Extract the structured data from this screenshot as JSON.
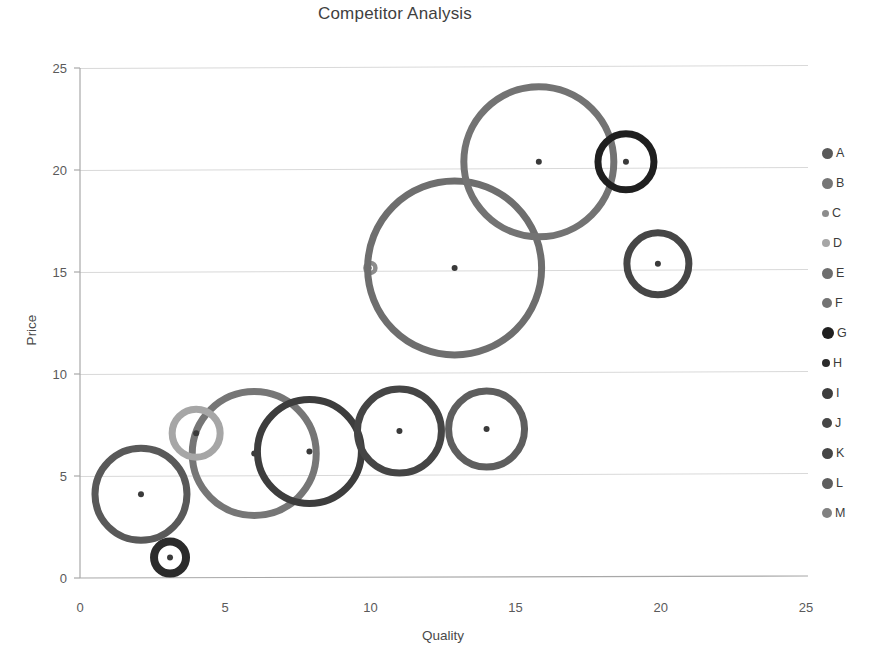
{
  "chart_data": {
    "type": "scatter",
    "title": "Competitor Analysis",
    "xlabel": "Quality",
    "ylabel": "Price",
    "xlim": [
      0,
      25
    ],
    "ylim": [
      0,
      25
    ],
    "xticks": [
      "0",
      "5",
      "10",
      "15",
      "20",
      "25"
    ],
    "yticks": [
      "0",
      "5",
      "10",
      "15",
      "20",
      "25"
    ],
    "grid": "horizontal",
    "legend_position": "right",
    "marker_style": "open-circle-with-center-dot",
    "series": [
      {
        "name": "A",
        "x": 2.1,
        "y": 4.1,
        "size": 46,
        "color": "#595959"
      },
      {
        "name": "B",
        "x": 6.0,
        "y": 6.1,
        "size": 62,
        "color": "#767676"
      },
      {
        "name": "C",
        "x": 10.0,
        "y": 15.2,
        "size": 5,
        "color": "#8c8c8c"
      },
      {
        "name": "D",
        "x": 4.0,
        "y": 7.1,
        "size": 24,
        "color": "#a6a6a6"
      },
      {
        "name": "E",
        "x": 12.9,
        "y": 15.2,
        "size": 87,
        "color": "#6e6e6e"
      },
      {
        "name": "F",
        "x": 15.8,
        "y": 20.4,
        "size": 75,
        "color": "#737373"
      },
      {
        "name": "G",
        "x": 18.8,
        "y": 20.4,
        "size": 28,
        "color": "#1f1f1f"
      },
      {
        "name": "H",
        "x": 3.1,
        "y": 1.0,
        "size": 16,
        "color": "#2b2b2b"
      },
      {
        "name": "I",
        "x": 7.9,
        "y": 6.2,
        "size": 52,
        "color": "#3d3d3d"
      },
      {
        "name": "J",
        "x": 19.9,
        "y": 15.4,
        "size": 31,
        "color": "#464646"
      },
      {
        "name": "K",
        "x": 11.0,
        "y": 7.2,
        "size": 42,
        "color": "#454545"
      },
      {
        "name": "L",
        "x": 14.0,
        "y": 7.3,
        "size": 38,
        "color": "#5e5e5e"
      },
      {
        "name": "M",
        "x": null,
        "y": null,
        "size": 0,
        "color": "#818181"
      }
    ]
  },
  "legend": {
    "items": [
      {
        "label": "A",
        "color": "#595959",
        "dot": 11
      },
      {
        "label": "B",
        "color": "#767676",
        "dot": 11
      },
      {
        "label": "C",
        "color": "#8c8c8c",
        "dot": 7
      },
      {
        "label": "D",
        "color": "#a6a6a6",
        "dot": 8
      },
      {
        "label": "E",
        "color": "#6e6e6e",
        "dot": 11
      },
      {
        "label": "F",
        "color": "#737373",
        "dot": 10
      },
      {
        "label": "G",
        "color": "#1f1f1f",
        "dot": 12
      },
      {
        "label": "H",
        "color": "#2b2b2b",
        "dot": 8
      },
      {
        "label": "I",
        "color": "#3d3d3d",
        "dot": 11
      },
      {
        "label": "J",
        "color": "#464646",
        "dot": 10
      },
      {
        "label": "K",
        "color": "#454545",
        "dot": 11
      },
      {
        "label": "L",
        "color": "#5e5e5e",
        "dot": 11
      },
      {
        "label": "M",
        "color": "#818181",
        "dot": 10
      }
    ]
  },
  "axes": {
    "x0_px": 80,
    "x1_px": 806,
    "y0_px": 578,
    "y1_px": 68,
    "grid_color": "#d9d9d9",
    "axis_color": "#a8a8a8"
  }
}
